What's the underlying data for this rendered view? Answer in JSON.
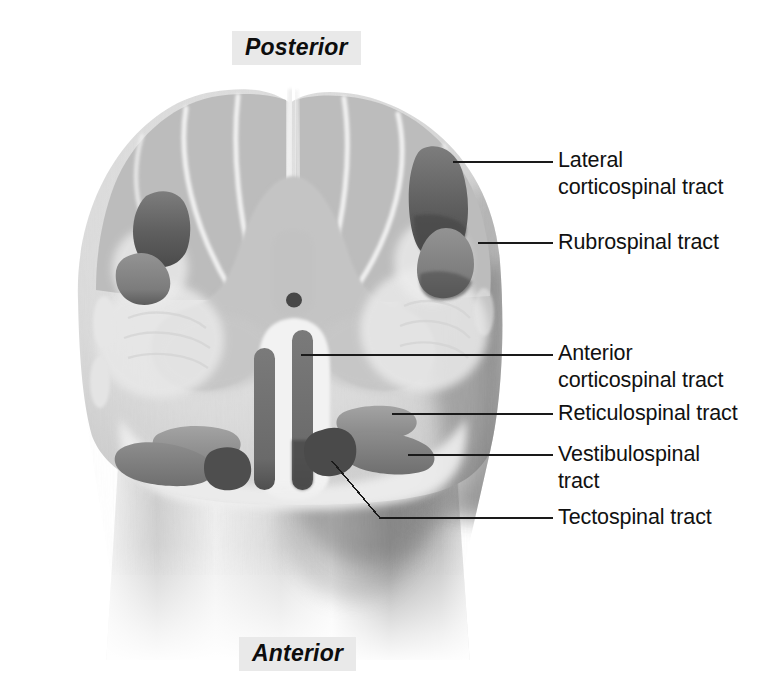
{
  "figure": {
    "orientation": {
      "posterior": "Posterior",
      "anterior": "Anterior"
    },
    "colors": {
      "background": "#ffffff",
      "white_matter": "#d8d8d8",
      "gray_matter": "#bdbdbd",
      "septa": "#efefef",
      "tract_dark": "#6e6e6e",
      "tract_darker": "#5a5a5a",
      "tract_mid": "#828282",
      "tract_light": "#9a9a9a",
      "central_canal": "#4a4a4a",
      "leader_line": "#1a1a1a",
      "label_text": "#111111",
      "orientation_box": "#e9e9e9"
    },
    "callouts": [
      {
        "id": "lateral-corticospinal",
        "text": "Lateral\ncorticospinal tract",
        "lines": [
          "Lateral",
          "corticospinal tract"
        ],
        "leader_y": 162,
        "anchor": [
          453,
          162
        ],
        "tract_shade": "#5f5f5f"
      },
      {
        "id": "rubrospinal",
        "text": "Rubrospinal tract",
        "lines": [
          "Rubrospinal tract"
        ],
        "leader_y": 243,
        "anchor": [
          483,
          243
        ],
        "tract_shade": "#7e7e7e"
      },
      {
        "id": "anterior-corticospinal",
        "text": "Anterior\ncorticospinal tract",
        "lines": [
          "Anterior",
          "corticospinal tract"
        ],
        "leader_y": 355,
        "anchor": [
          300,
          355
        ],
        "tract_shade": "#6a6a6a"
      },
      {
        "id": "reticulospinal",
        "text": "Reticulospinal tract",
        "lines": [
          "Reticulospinal tract"
        ],
        "leader_y": 414,
        "anchor": [
          392,
          414
        ],
        "tract_shade": "#8e8e8e"
      },
      {
        "id": "vestibulospinal",
        "text": "Vestibulospinal\ntract",
        "lines": [
          "Vestibulospinal",
          "tract"
        ],
        "leader_y": 455,
        "anchor": [
          404,
          455
        ],
        "tract_shade": "#7a7a7a"
      },
      {
        "id": "tectospinal",
        "text": "Tectospinal tract",
        "lines": [
          "Tectospinal tract"
        ],
        "leader_y": 518,
        "anchor": [
          335,
          464
        ],
        "tract_shade": "#555555"
      }
    ],
    "anatomy": {
      "structures": [
        "posterior columns",
        "posterior median sulcus",
        "gray matter butterfly",
        "central canal",
        "anterior median fissure",
        "white matter",
        "lateral corticospinal tract (paired)",
        "rubrospinal tract (paired)",
        "anterior corticospinal tract (paired)",
        "reticulospinal tract (paired)",
        "vestibulospinal tract (paired)",
        "tectospinal tract (paired)"
      ]
    }
  }
}
